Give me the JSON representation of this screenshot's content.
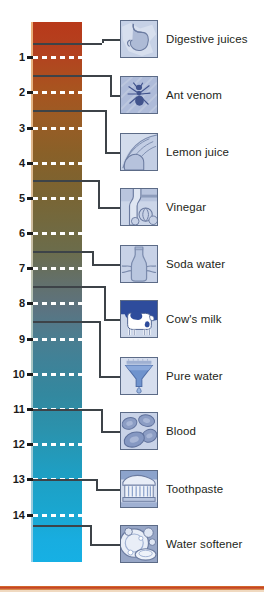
{
  "diagram": {
    "axis": {
      "tick_labels": [
        "1",
        "2",
        "3",
        "4",
        "5",
        "6",
        "7",
        "8",
        "9",
        "10",
        "11",
        "12",
        "13",
        "14"
      ],
      "tick_values": [
        1,
        2,
        3,
        4,
        5,
        6,
        7,
        8,
        9,
        10,
        11,
        12,
        13,
        14
      ]
    },
    "gradient": {
      "acid_color": "#b8391a",
      "mid_color": "#6c6c4a",
      "base_color": "#16b0e4"
    },
    "accent_rule_color": "#c23a22"
  },
  "items": [
    {
      "label": "Digestive juices",
      "icon": "stomach-icon",
      "ph": 0.6
    },
    {
      "label": "Ant venom",
      "icon": "ant-icon",
      "ph": 1.5
    },
    {
      "label": "Lemon juice",
      "icon": "lemon-icon",
      "ph": 2.5
    },
    {
      "label": "Vinegar",
      "icon": "vinegar-bottle-icon",
      "ph": 4.5
    },
    {
      "label": "Soda water",
      "icon": "soda-bottle-icon",
      "ph": 6.5
    },
    {
      "label": "Cow's milk",
      "icon": "cow-icon",
      "ph": 7.5
    },
    {
      "label": "Pure water",
      "icon": "funnel-drop-icon",
      "ph": 8.5
    },
    {
      "label": "Blood",
      "icon": "blood-cells-icon",
      "ph": 11
    },
    {
      "label": "Toothpaste",
      "icon": "toothpaste-icon",
      "ph": 13
    },
    {
      "label": "Water softener",
      "icon": "dishes-icon",
      "ph": 14.3
    }
  ]
}
